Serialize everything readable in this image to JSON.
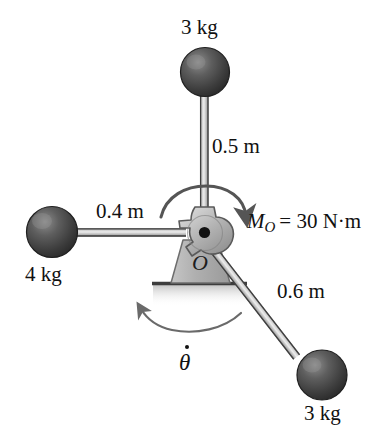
{
  "figure": {
    "pivot_label": "O",
    "angular_rate_label": "θ",
    "moment": {
      "symbol": "M",
      "subscript": "O",
      "equals_value": "= 30 N·m",
      "full_text": "M_O = 30 N·m"
    },
    "arms": [
      {
        "name": "top-arm",
        "length_label": "0.5 m",
        "mass_label": "3 kg",
        "direction": "up"
      },
      {
        "name": "left-arm",
        "length_label": "0.4 m",
        "mass_label": "4 kg",
        "direction": "left"
      },
      {
        "name": "lower-right-arm",
        "length_label": "0.6 m",
        "mass_label": "3 kg",
        "direction": "down-right"
      }
    ],
    "colors": {
      "sphere_dark": "#3a3a3a",
      "sphere_light": "#8f8f8f",
      "rod_light": "#d8d8d8",
      "rod_edge": "#4a4a4a",
      "hub_fill": "#b9b9b9",
      "hub_edge": "#4f4f4f",
      "ground": "#3d3d3d",
      "arc": "#555555",
      "text": "#111111"
    }
  }
}
